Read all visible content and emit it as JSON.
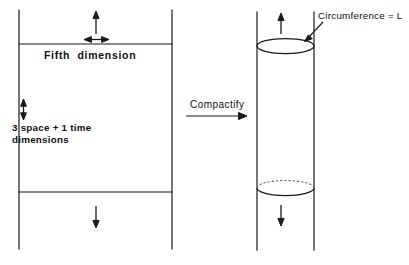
{
  "figure": {
    "stroke_color": "#1a1a1a",
    "background_color": "#ffffff",
    "hidden_line_color": "#5a5a5a"
  },
  "left_panel": {
    "name": "uncompactified-spacetime-slab",
    "fifth_dimension_label": "Fifth  dimension",
    "four_dimensions_label": "3 space + 1 time\ndimensions",
    "arrows": {
      "top_up": "up-arrow",
      "bottom_down": "down-arrow",
      "fifth_dimension_extent": "horizontal-double-arrow",
      "four_dimension_extent": "vertical-double-arrow"
    }
  },
  "transition": {
    "label": "Compactify",
    "arrow": "right-arrow"
  },
  "right_panel": {
    "name": "compactified-cylinder",
    "circumference_label": "Circumference = L",
    "arrows": {
      "top_up": "up-arrow",
      "bottom_down": "down-arrow"
    },
    "leader": "leader-arrow-to-top-ellipse"
  }
}
